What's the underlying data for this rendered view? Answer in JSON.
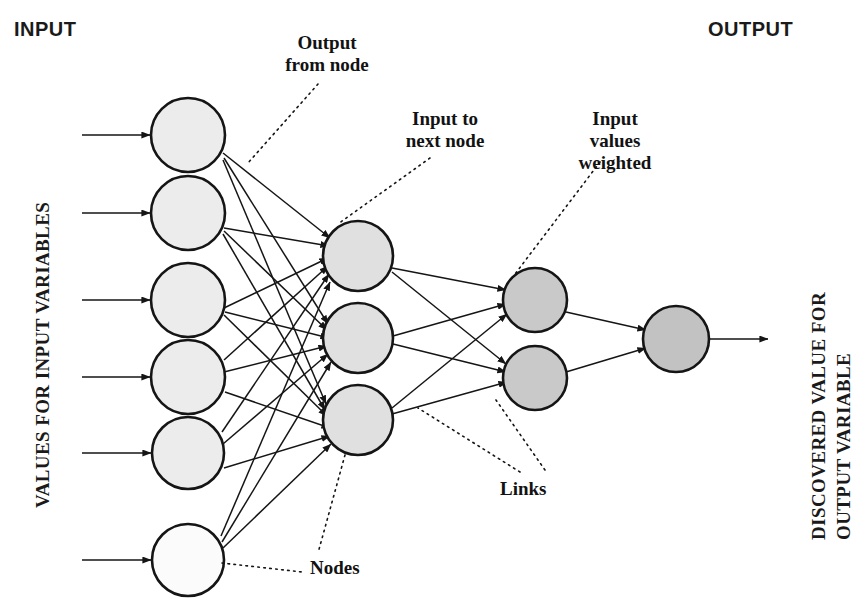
{
  "diagram": {
    "headers": {
      "input": "INPUT",
      "output": "OUTPUT"
    },
    "side_labels": {
      "input": "VALUES FOR INPUT VARIABLES",
      "output_line1": "DISCOVERED VALUE FOR",
      "output_line2": "OUTPUT VARIABLE"
    },
    "annotations": {
      "output_from_node": "Output\nfrom node",
      "input_to_next_node": "Input to\nnext node",
      "input_values_weighted": "Input\nvalues\nweighted",
      "nodes": "Nodes",
      "links": "Links"
    },
    "colors": {
      "stroke": "#151515",
      "input_node_fill": "#ececec",
      "hidden_node_fill": "#e0e0e0",
      "weighted_node_fill": "#c9c9c9",
      "output_node_fill": "#c2c2c2",
      "text": "#151515",
      "background": "#ffffff"
    },
    "layers": [
      {
        "name": "input-layer",
        "node_count": 6,
        "fill": "#ececec",
        "nodes": [
          {
            "cx": 188,
            "cy": 135,
            "r": 37
          },
          {
            "cx": 188,
            "cy": 213,
            "r": 37
          },
          {
            "cx": 188,
            "cy": 300,
            "r": 37
          },
          {
            "cx": 188,
            "cy": 377,
            "r": 37
          },
          {
            "cx": 188,
            "cy": 453,
            "r": 36
          },
          {
            "cx": 188,
            "cy": 560,
            "r": 36
          }
        ]
      },
      {
        "name": "hidden-layer",
        "node_count": 3,
        "fill": "#e0e0e0",
        "nodes": [
          {
            "cx": 358,
            "cy": 256,
            "r": 35
          },
          {
            "cx": 358,
            "cy": 338,
            "r": 35
          },
          {
            "cx": 358,
            "cy": 420,
            "r": 35
          }
        ]
      },
      {
        "name": "weighted-layer",
        "node_count": 2,
        "fill": "#c9c9c9",
        "nodes": [
          {
            "cx": 535,
            "cy": 300,
            "r": 32
          },
          {
            "cx": 535,
            "cy": 378,
            "r": 32
          }
        ]
      },
      {
        "name": "output-layer",
        "node_count": 1,
        "fill": "#c2c2c2",
        "nodes": [
          {
            "cx": 676,
            "cy": 339,
            "r": 33
          }
        ]
      }
    ],
    "input_arrows": [
      {
        "x1": 82,
        "y1": 135,
        "x2": 150,
        "y2": 135
      },
      {
        "x1": 82,
        "y1": 213,
        "x2": 150,
        "y2": 213
      },
      {
        "x1": 82,
        "y1": 300,
        "x2": 150,
        "y2": 300
      },
      {
        "x1": 82,
        "y1": 377,
        "x2": 150,
        "y2": 377
      },
      {
        "x1": 82,
        "y1": 453,
        "x2": 151,
        "y2": 453
      },
      {
        "x1": 82,
        "y1": 560,
        "x2": 151,
        "y2": 560
      }
    ],
    "output_arrow": {
      "x1": 710,
      "y1": 339,
      "x2": 768,
      "y2": 339
    },
    "leaders": [
      {
        "name": "output-from-node",
        "x1": 318,
        "y1": 84,
        "x2": 248,
        "y2": 163
      },
      {
        "name": "input-to-next-node",
        "x1": 430,
        "y1": 158,
        "x2": 338,
        "y2": 224
      },
      {
        "name": "input-values-weighted",
        "x1": 600,
        "y1": 162,
        "x2": 512,
        "y2": 278
      },
      {
        "name": "nodes-to-hidden",
        "x1": 345,
        "y1": 455,
        "x2": 318,
        "y2": 553
      },
      {
        "name": "nodes-to-input6",
        "x1": 222,
        "y1": 563,
        "x2": 302,
        "y2": 572
      },
      {
        "name": "links-to-layer2",
        "x1": 520,
        "y1": 472,
        "x2": 418,
        "y2": 410
      },
      {
        "name": "links-to-layer3",
        "x1": 545,
        "y1": 470,
        "x2": 498,
        "y2": 400
      }
    ]
  }
}
